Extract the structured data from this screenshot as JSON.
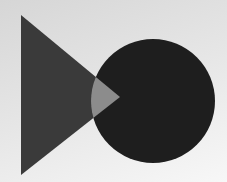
{
  "scene": {
    "width": 227,
    "height": 182,
    "background": {
      "start": "#d6d6d6",
      "mid": "#e6e6e6",
      "end": "#f7f7f7"
    },
    "triangle": {
      "points": "21,15 120,97 21,175",
      "fill": "#3a3a3a"
    },
    "circle": {
      "cx": 153,
      "cy": 101,
      "r": 62,
      "fill": "#1e1e1e"
    },
    "overlap": {
      "fill": "#8c8c8c"
    }
  }
}
